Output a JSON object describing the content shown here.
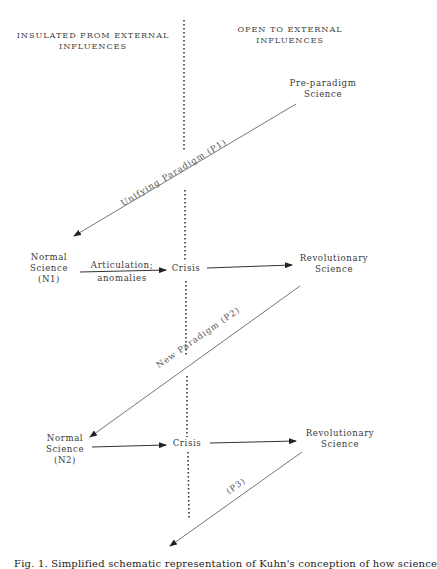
{
  "headers": {
    "left": [
      "INSULATED FROM EXTERNAL",
      "INFLUENCES"
    ],
    "right": [
      "OPEN TO EXTERNAL",
      "INFLUENCES"
    ]
  },
  "nodes": {
    "pre_paradigm": [
      "Pre-paradigm",
      "Science"
    ],
    "normal_science_1": [
      "Normal",
      "Science",
      "(N1)"
    ],
    "crisis_1": "Crisis",
    "revolutionary_1": [
      "Revolutionary",
      "Science"
    ],
    "normal_science_2": [
      "Normal",
      "Science",
      "(N2)"
    ],
    "crisis_2": "Crisis",
    "revolutionary_2": [
      "Revolutionary",
      "Science"
    ]
  },
  "edge_labels": {
    "unifying_paradigm": "Unifying  Paradigm (P1)",
    "articulation_top": "Articulation;",
    "articulation_bottom": "anomalies",
    "new_paradigm": "New Paradigm (P2)",
    "p3": "(P3)"
  },
  "caption": "Fig. 1. Simplified schematic representation of Kuhn's conception of how science",
  "colors": {
    "line": "#555555",
    "arrow": "#222222",
    "text": "#3a3a3a"
  }
}
